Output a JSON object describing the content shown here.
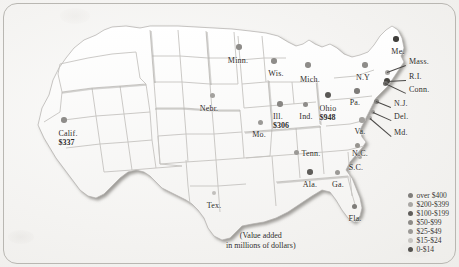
{
  "figure": {
    "background_color": "#f4f3f1",
    "frame_color": "#b9b7b2",
    "land_fill": "#fdfdfc",
    "border_shadow": "#9c9a96"
  },
  "caption": {
    "line1": "(Value added",
    "line2": "in millions of dollars)"
  },
  "legend": {
    "title": "",
    "items": [
      {
        "label": "over $400",
        "color": "#807e7b"
      },
      {
        "label": "$200-$399",
        "color": "#a9a7a4"
      },
      {
        "label": "$100-$199",
        "color": "#5f5d5a"
      },
      {
        "label": "$50-$99",
        "color": "#8d8b88"
      },
      {
        "label": "$25-$49",
        "color": "#9b9996"
      },
      {
        "label": "$15-$24",
        "color": "#c6c4c1"
      },
      {
        "label": "0-$14",
        "color": "#54524f"
      }
    ]
  },
  "chart_data": {
    "type": "map",
    "title": "Value added in millions of dollars",
    "unit": "millions of dollars",
    "labeled_values": [
      {
        "state": "Ohio",
        "value": 948
      },
      {
        "state": "Calif.",
        "value": 337
      },
      {
        "state": "Ill.",
        "value": 306
      }
    ],
    "legend_bins": [
      "over $400",
      "$200-$399",
      "$100-$199",
      "$50-$99",
      "$25-$49",
      "$15-$24",
      "0-$14"
    ],
    "markers": [
      {
        "name": "Minn.",
        "value": null,
        "x": 238,
        "y": 57,
        "dot_x": 239,
        "dot_y": 47,
        "dot_size": 5.5,
        "dot_color": "#8e8c89",
        "align": "center"
      },
      {
        "name": "Wis.",
        "value": null,
        "x": 276,
        "y": 70,
        "dot_x": 274,
        "dot_y": 61,
        "dot_size": 5.5,
        "dot_color": "#8e8c89",
        "align": "center"
      },
      {
        "name": "Mich.",
        "value": null,
        "x": 310,
        "y": 76,
        "dot_x": 308,
        "dot_y": 65,
        "dot_size": 5.5,
        "dot_color": "#8e8c89",
        "align": "center"
      },
      {
        "name": "Nebr.",
        "value": null,
        "x": 209,
        "y": 105,
        "dot_x": 212,
        "dot_y": 95,
        "dot_size": 5,
        "dot_color": "#a3a19e",
        "align": "center"
      },
      {
        "name": "Mo.",
        "value": null,
        "x": 259,
        "y": 131,
        "dot_x": 260,
        "dot_y": 122,
        "dot_size": 5,
        "dot_color": "#9b9996",
        "align": "center"
      },
      {
        "name": "Ill.",
        "value": 306,
        "x": 281,
        "y": 113,
        "dot_x": 280,
        "dot_y": 104,
        "dot_size": 5.5,
        "dot_color": "#888683",
        "align": "center"
      },
      {
        "name": "Ind.",
        "value": null,
        "x": 306,
        "y": 113,
        "dot_x": 305,
        "dot_y": 104,
        "dot_size": 5,
        "dot_color": "#8e8c89",
        "align": "center"
      },
      {
        "name": "Ohio",
        "value": 948,
        "x": 328,
        "y": 105,
        "dot_x": 328,
        "dot_y": 95,
        "dot_size": 6,
        "dot_color": "#5a5855",
        "align": "center"
      },
      {
        "name": "Calif.",
        "value": 337,
        "x": 68,
        "y": 130,
        "dot_x": 64,
        "dot_y": 120,
        "dot_size": 5.5,
        "dot_color": "#8e8c89",
        "align": "center"
      },
      {
        "name": "Tex.",
        "value": null,
        "x": 214,
        "y": 202,
        "dot_x": 214,
        "dot_y": 193,
        "dot_size": 4.5,
        "dot_color": "#c1bfbc",
        "align": "center"
      },
      {
        "name": "Tenn.",
        "value": null,
        "x": 311,
        "y": 150,
        "dot_x": 296,
        "dot_y": 152,
        "dot_size": 5,
        "dot_color": "#9b9996",
        "align": "center"
      },
      {
        "name": "Ala.",
        "value": null,
        "x": 310,
        "y": 181,
        "dot_x": 310,
        "dot_y": 172,
        "dot_size": 5.5,
        "dot_color": "#5f5d5a",
        "align": "center"
      },
      {
        "name": "Ga.",
        "value": null,
        "x": 338,
        "y": 181,
        "dot_x": 337,
        "dot_y": 172,
        "dot_size": 5,
        "dot_color": "#9b9996",
        "align": "center"
      },
      {
        "name": "Fla.",
        "value": null,
        "x": 355,
        "y": 215,
        "dot_x": 354,
        "dot_y": 206,
        "dot_size": 5,
        "dot_color": "#7e7c79",
        "align": "center"
      },
      {
        "name": "S.C.",
        "value": null,
        "x": 356,
        "y": 164,
        "dot_x": 360,
        "dot_y": 157,
        "dot_size": 4.5,
        "dot_color": "#aaa8a5",
        "align": "center"
      },
      {
        "name": "N.C.",
        "value": null,
        "x": 360,
        "y": 150,
        "dot_x": 357,
        "dot_y": 145,
        "dot_size": 5,
        "dot_color": "#96948f",
        "align": "center"
      },
      {
        "name": "Va.",
        "value": null,
        "x": 360,
        "y": 128,
        "dot_x": 362,
        "dot_y": 120,
        "dot_size": 5.5,
        "dot_color": "#a3a19e",
        "align": "center"
      },
      {
        "name": "Pa.",
        "value": null,
        "x": 355,
        "y": 99,
        "dot_x": 357,
        "dot_y": 91,
        "dot_size": 5.5,
        "dot_color": "#7e7c79",
        "align": "center"
      },
      {
        "name": "N.Y",
        "value": null,
        "x": 363,
        "y": 74,
        "dot_x": 365,
        "dot_y": 65,
        "dot_size": 5.5,
        "dot_color": "#8e8c89",
        "align": "center"
      },
      {
        "name": "Me.",
        "value": null,
        "x": 398,
        "y": 48,
        "dot_x": 396,
        "dot_y": 39,
        "dot_size": 5.5,
        "dot_color": "#403e3b",
        "align": "center"
      }
    ],
    "callouts": [
      {
        "name": "Mass.",
        "label_x": 409,
        "label_y": 62,
        "dot_x": 387,
        "dot_y": 72,
        "dot_size": 5,
        "dot_color": "#a9a7a4"
      },
      {
        "name": "R.I.",
        "label_x": 409,
        "label_y": 77,
        "dot_x": 387,
        "dot_y": 81,
        "dot_size": 6,
        "dot_color": "#46443f"
      },
      {
        "name": "Conn.",
        "label_x": 409,
        "label_y": 90,
        "dot_x": 385,
        "dot_y": 83,
        "dot_size": 5,
        "dot_color": "#6d6b68"
      },
      {
        "name": "N.J.",
        "label_x": 394,
        "label_y": 104,
        "dot_x": 376,
        "dot_y": 101,
        "dot_size": 5,
        "dot_color": "#84827f"
      },
      {
        "name": "Del.",
        "label_x": 394,
        "label_y": 117,
        "dot_x": 373,
        "dot_y": 112,
        "dot_size": 4.5,
        "dot_color": "#9a9895"
      },
      {
        "name": "Md.",
        "label_x": 394,
        "label_y": 133,
        "dot_x": 370,
        "dot_y": 118,
        "dot_size": 4.5,
        "dot_color": "#a8a6a3"
      }
    ]
  }
}
